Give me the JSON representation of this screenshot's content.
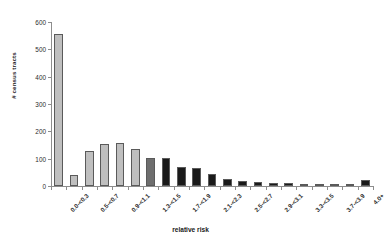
{
  "chart_data": {
    "type": "bar",
    "title": "",
    "xlabel": "relative risk",
    "ylabel": "# census tracts",
    "ylim": [
      0,
      600
    ],
    "yticks": [
      0,
      100,
      200,
      300,
      400,
      500,
      600
    ],
    "ytick_labels": [
      "0",
      "100",
      "200",
      "300",
      "400",
      "500",
      "600"
    ],
    "grid": false,
    "legend": "none",
    "categories": [
      "0.0-<0.3",
      "0.3-<0.5",
      "0.5-<0.7",
      "0.7-<0.9",
      "0.9-<1.1",
      "1.1-<1.3",
      "1.3-<1.5",
      "1.5-<1.7",
      "1.7-<1.9",
      "1.9-<2.1",
      "2.1-<2.3",
      "2.3-<2.5",
      "2.5-<2.7",
      "2.7-<2.9",
      "2.9-<3.1",
      "3.1-<3.3",
      "3.3-<3.5",
      "3.5-<3.7",
      "3.7-<3.9",
      "3.9-<4.0",
      "4.0+"
    ],
    "tick_labels_shown": [
      "0.0-<0.3",
      "0.5-<0.7",
      "0.9-<1.1",
      "1.3-<1.5",
      "1.7-<1.9",
      "2.1-<2.3",
      "2.5-<2.7",
      "2.9-<3.1",
      "3.3-<3.5",
      "3.7-<3.9",
      "4.0+"
    ],
    "values": [
      555,
      42,
      128,
      155,
      157,
      137,
      103,
      102,
      68,
      66,
      45,
      26,
      20,
      16,
      11,
      12,
      7,
      3,
      4,
      3,
      22
    ],
    "bar_colors": [
      "#bfbfbf",
      "#bfbfbf",
      "#bfbfbf",
      "#bfbfbf",
      "#bfbfbf",
      "#bfbfbf",
      "#6e6e6e",
      "#1a1a1a",
      "#1a1a1a",
      "#1a1a1a",
      "#1a1a1a",
      "#1a1a1a",
      "#1a1a1a",
      "#1a1a1a",
      "#1a1a1a",
      "#1a1a1a",
      "#1a1a1a",
      "#1a1a1a",
      "#1a1a1a",
      "#1a1a1a",
      "#1a1a1a"
    ],
    "bar_edge_color": "#5a5a5a",
    "axis_color": "#8d8d8d",
    "background": "#ffffff"
  }
}
